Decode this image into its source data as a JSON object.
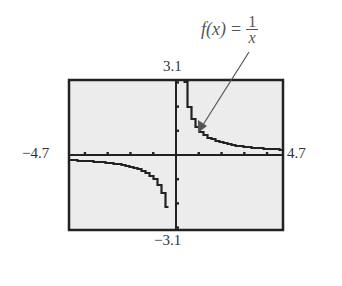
{
  "chart_data": {
    "type": "line",
    "title": "",
    "annotation": {
      "text_lhs": "f(x) =",
      "numerator": "1",
      "denominator": "x",
      "full": "f(x) = 1/x"
    },
    "function": "1/x",
    "xlabel": "",
    "ylabel": "",
    "xlim": [
      -4.7,
      4.7
    ],
    "ylim": [
      -3.1,
      3.1
    ],
    "x_tick_step": 1,
    "y_tick_step": 1,
    "window_labels": {
      "xmin": "−4.7",
      "xmax": "4.7",
      "ymin": "−3.1",
      "ymax": "3.1"
    },
    "grid": false,
    "legend": null,
    "series": [
      {
        "name": "f(x) = 1/x",
        "x": [
          -4.7,
          -4,
          -3,
          -2,
          -1.5,
          -1,
          -0.75,
          -0.5,
          -0.4,
          -0.35,
          0.35,
          0.4,
          0.5,
          0.75,
          1,
          1.5,
          2,
          3,
          4,
          4.7
        ],
        "y": [
          -0.21,
          -0.25,
          -0.33,
          -0.5,
          -0.67,
          -1,
          -1.33,
          -2,
          -2.5,
          -2.86,
          2.86,
          2.5,
          2,
          1.33,
          1,
          0.67,
          0.5,
          0.33,
          0.25,
          0.21
        ]
      }
    ],
    "style": {
      "background": "#ececec",
      "frame": "#222222",
      "curve": "#222222",
      "arrow": "#555555"
    }
  }
}
